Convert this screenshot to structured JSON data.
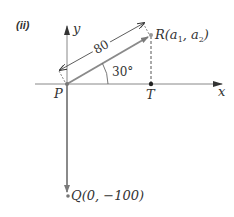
{
  "figure": {
    "part_label": "(ii)",
    "axes": {
      "x_label": "x",
      "y_label": "y"
    },
    "points": {
      "P": {
        "label": "P"
      },
      "T": {
        "label": "T"
      },
      "R": {
        "label": "R(a",
        "sub1": "1",
        "mid": ", a",
        "sub2": "2",
        "end": ")"
      },
      "Q": {
        "label": "Q(0,  −100)"
      }
    },
    "vector_PR_length": "80",
    "angle_label": "30°",
    "colors": {
      "vector": "#8a8a8a",
      "axis": "#7a7a7a",
      "text": "#333333",
      "point": "#222222"
    }
  }
}
